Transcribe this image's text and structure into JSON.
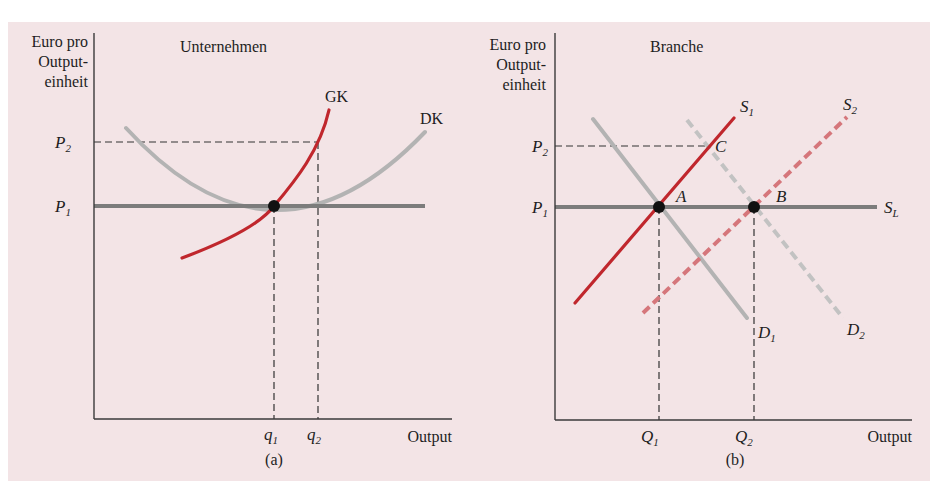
{
  "figure": {
    "background_color": "#f3e4e6",
    "colors": {
      "axis": "#3a3a3a",
      "price_line": "#7c7c7c",
      "red_curve": "#c0272d",
      "red_dashed": "#d5767b",
      "gray_curve": "#b3b3b3",
      "gray_dashed": "#c2c2c2",
      "guide_dashed": "#333333",
      "point": "#111111"
    }
  },
  "panel_a": {
    "title": "Unternehmen",
    "caption": "(a)",
    "y_axis_label": [
      "Euro pro",
      "Output-",
      "einheit"
    ],
    "x_axis_label": "Output",
    "price_labels": {
      "p2": "P",
      "p2_sub": "2",
      "p1": "P",
      "p1_sub": "1"
    },
    "quantity_labels": {
      "q1": "q",
      "q1_sub": "1",
      "q2": "q",
      "q2_sub": "2"
    },
    "curves": {
      "marginal_cost": "GK",
      "average_cost": "DK"
    }
  },
  "panel_b": {
    "title": "Branche",
    "caption": "(b)",
    "y_axis_label": [
      "Euro pro",
      "Output-",
      "einheit"
    ],
    "x_axis_label": "Output",
    "price_labels": {
      "p2": "P",
      "p2_sub": "2",
      "p1": "P",
      "p1_sub": "1"
    },
    "quantity_labels": {
      "q1": "Q",
      "q1_sub": "1",
      "q2": "Q",
      "q2_sub": "2"
    },
    "curves": {
      "s1": "S",
      "s1_sub": "1",
      "s2": "S",
      "s2_sub": "2",
      "sl": "S",
      "sl_sub": "L",
      "d1": "D",
      "d1_sub": "1",
      "d2": "D",
      "d2_sub": "2"
    },
    "points": {
      "a": "A",
      "b": "B",
      "c": "C"
    }
  }
}
